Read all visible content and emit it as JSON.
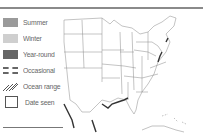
{
  "header": {
    "bar_color": "#8a8a8a"
  },
  "legend": {
    "items": [
      {
        "label": "Summer",
        "type": "fill",
        "color": "#9a9a9a"
      },
      {
        "label": "Winter",
        "type": "fill",
        "color": "#cfcfcf"
      },
      {
        "label": "Year-round",
        "type": "fill",
        "color": "#666666"
      },
      {
        "label": "Occasional",
        "type": "dashed"
      },
      {
        "label": "Ocean range",
        "type": "hatch"
      },
      {
        "label": "Date seen",
        "type": "outline"
      }
    ]
  },
  "map": {
    "region": "United States (contiguous) with Gulf coast and Caribbean"
  }
}
